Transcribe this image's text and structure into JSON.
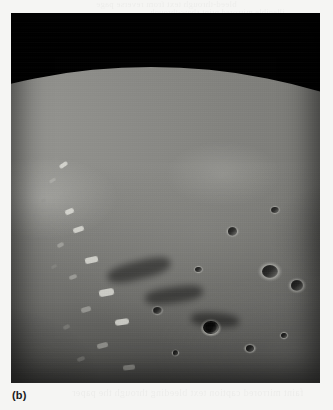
{
  "page": {
    "background_color": "#f5f5f3",
    "showthrough_top_line1": "bleed-through text from reverse page",
    "showthrough_top_line2": "illegible mirrored print show-through",
    "showthrough_bottom": "faint mirrored caption text bleeding through the paper"
  },
  "figure": {
    "caption_label": "(b)",
    "photo": {
      "x": 11,
      "y": 13,
      "width": 309,
      "height": 370,
      "space_color": "#000000",
      "sunlit_surface_color": "#8e8e8a",
      "basin_floor_color": "#3a3a38",
      "rim_highlight_color": "#d6d6d0",
      "terminator_shadow_color": "#000000"
    },
    "features": [
      {
        "name": "lunar-limb",
        "description": "curved horizon against black space across the upper portion"
      },
      {
        "name": "impact-basin",
        "description": "large circular basin with dark smooth flooded floor"
      },
      {
        "name": "basin-rim",
        "description": "bright rugged mountainous ring surrounding the basin floor"
      },
      {
        "name": "terminator",
        "description": "day-night boundary shadowing the left side of the frame"
      },
      {
        "name": "foreground-highlands",
        "description": "heavily cratered rugged terrain in the lower foreground"
      },
      {
        "name": "sharp-crater",
        "description": "crisp bright-rimmed crater with shadowed interior, lower right"
      }
    ]
  }
}
